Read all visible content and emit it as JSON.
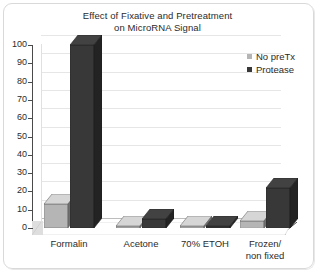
{
  "chart_data": {
    "type": "bar",
    "title": "Effect of Fixative and Pretreatment on MicroRNA Signal",
    "title_line1": "Effect of Fixative and Pretreatment",
    "title_line2": "on MicroRNA Signal",
    "xlabel": "",
    "ylabel": "",
    "ylim": [
      0,
      100
    ],
    "ytick_step": 10,
    "grid": true,
    "legend_position": "top-right",
    "three_d": true,
    "categories": [
      "Formalin",
      "Acetone",
      "70% ETOH",
      "Frozen/ non fixed"
    ],
    "category_lines": [
      [
        "Formalin"
      ],
      [
        "Acetone"
      ],
      [
        "70% ETOH"
      ],
      [
        "Frozen/",
        "non fixed"
      ]
    ],
    "ticks": [
      "0",
      "10",
      "20",
      "30",
      "40",
      "50",
      "60",
      "70",
      "80",
      "90",
      "100"
    ],
    "series": [
      {
        "name": "No preTx",
        "color": "#b5b5b5",
        "values": [
          13,
          1,
          1,
          4
        ]
      },
      {
        "name": "Protease",
        "color": "#383838",
        "values": [
          100,
          5,
          1,
          22
        ]
      }
    ]
  },
  "legend": {
    "items": [
      {
        "label": "No preTx",
        "color": "#b5b5b5"
      },
      {
        "label": "Protease",
        "color": "#383838"
      }
    ]
  },
  "colors": {
    "series_no_pretx": "#b5b5b5",
    "series_protease": "#383838",
    "grid": "#e6e6e6",
    "axis": "#4a4a4a",
    "text": "#2b2b2b",
    "background": "#ffffff"
  }
}
